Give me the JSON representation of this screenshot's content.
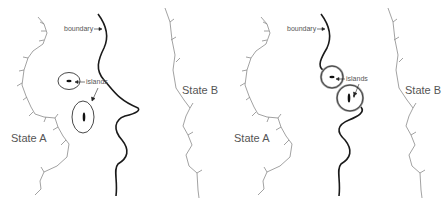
{
  "panels": [
    {
      "id": "left",
      "labels": {
        "boundary": "boundary",
        "islands": "islands",
        "state_a": "State A",
        "state_b": "State B"
      },
      "islands_style": "full ellipses (thin black)"
    },
    {
      "id": "right",
      "labels": {
        "boundary": "boundary",
        "islands": "islands",
        "state_a": "State A",
        "state_b": "State B"
      },
      "islands_style": "circles with gray ring joined to boundary"
    }
  ],
  "colors": {
    "boundary": "#1a1a1a",
    "coast": "#8a8a8a",
    "island_ring": "#333333",
    "island_ring_gray": "#9a9a9a",
    "text": "#555555"
  }
}
